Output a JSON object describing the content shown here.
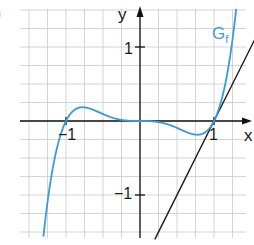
{
  "figure": {
    "part_label": ")",
    "curve_label": "G",
    "curve_label_sub": "f",
    "x_axis_label": "x",
    "y_axis_label": "y",
    "tick_x_neg1": "−1",
    "tick_x_1": "1",
    "tick_y_1": "1",
    "tick_y_neg1": "−1"
  },
  "colors": {
    "curve": "#3a9ad9",
    "tangent": "#1a1a1a",
    "axes": "#111111",
    "grid": "#c9c9c9"
  },
  "chart_data": {
    "type": "line",
    "title": "",
    "xlabel": "x",
    "ylabel": "y",
    "xlim": [
      -1.6,
      1.55
    ],
    "ylim": [
      -1.6,
      1.5
    ],
    "grid": true,
    "grid_step": 0.25,
    "x_ticks": [
      -1,
      1
    ],
    "y_ticks": [
      -1,
      1
    ],
    "legend": null,
    "annotations": [
      "G_f"
    ],
    "series": [
      {
        "name": "G_f",
        "description": "graph of f(x) = x^5 - x^3",
        "x": [
          -1.2,
          -1.1,
          -1.0,
          -0.9,
          -0.775,
          -0.6,
          -0.4,
          -0.2,
          0,
          0.2,
          0.4,
          0.6,
          0.775,
          0.9,
          1.0,
          1.1,
          1.2,
          1.3
        ],
        "values": [
          -0.76,
          -0.28,
          0.0,
          0.14,
          0.186,
          0.138,
          0.054,
          0.008,
          0.0,
          -0.008,
          -0.054,
          -0.138,
          -0.186,
          -0.14,
          0.0,
          0.28,
          0.76,
          1.52
        ]
      },
      {
        "name": "tangent at x=1",
        "description": "y = 2x - 2",
        "x": [
          0.2,
          1.55
        ],
        "values": [
          -1.6,
          1.1
        ]
      }
    ]
  }
}
